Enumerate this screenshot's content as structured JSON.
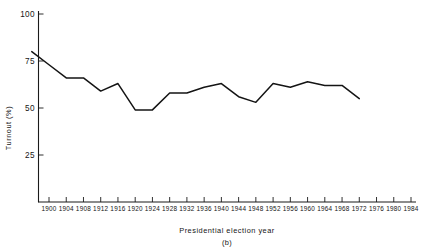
{
  "chart_data": {
    "type": "line",
    "title": "",
    "xlabel": "Presidential election year",
    "ylabel": "Turnout (%)",
    "panel_label": "(b)",
    "grid": false,
    "legend": "none",
    "xlim": [
      1896,
      1984
    ],
    "ylim": [
      0,
      100
    ],
    "y_ticks": [
      25,
      50,
      75,
      100
    ],
    "x_ticks": [
      1900,
      1904,
      1908,
      1912,
      1916,
      1920,
      1924,
      1928,
      1932,
      1936,
      1940,
      1944,
      1948,
      1952,
      1956,
      1960,
      1964,
      1968,
      1972,
      1976,
      1980,
      1984
    ],
    "x": [
      1896,
      1900,
      1904,
      1908,
      1912,
      1916,
      1920,
      1924,
      1928,
      1932,
      1936,
      1940,
      1944,
      1948,
      1952,
      1956,
      1960,
      1964,
      1968,
      1972
    ],
    "values": [
      80,
      73,
      66,
      66,
      59,
      63,
      49,
      49,
      58,
      58,
      61,
      63,
      56,
      53,
      63,
      61,
      64,
      62,
      62,
      55
    ],
    "series": [
      {
        "name": "Turnout",
        "color": "#141414",
        "values": [
          80,
          73,
          66,
          66,
          59,
          63,
          49,
          49,
          58,
          58,
          61,
          63,
          56,
          53,
          63,
          61,
          64,
          62,
          62,
          55
        ]
      }
    ]
  },
  "y_tick_labels": [
    "100",
    "75",
    "50",
    "25"
  ],
  "x_tick_labels": [
    "1900",
    "1904",
    "1908",
    "1912",
    "1916",
    "1920",
    "1924",
    "1928",
    "1932",
    "1936",
    "1940",
    "1944",
    "1948",
    "1952",
    "1956",
    "1960",
    "1964",
    "1968",
    "1972",
    "1976",
    "1980",
    "1984"
  ],
  "axis": {
    "x_title": "Presidential election year",
    "y_title": "Turnout (%)"
  },
  "figure": {
    "panel_label": "(b)"
  }
}
